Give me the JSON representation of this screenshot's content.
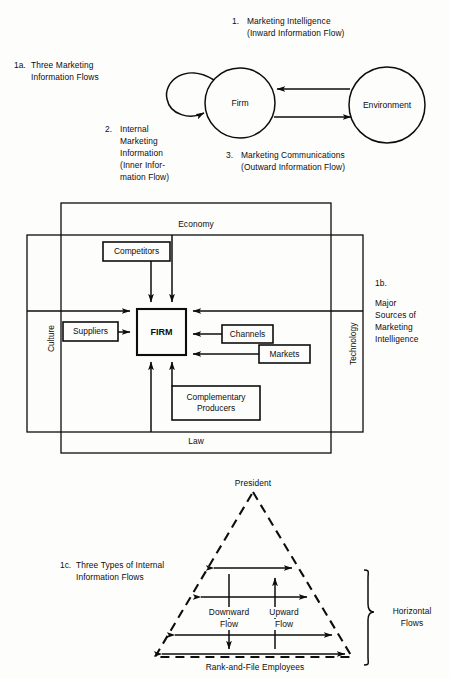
{
  "figure": {
    "panel_a": {
      "key": "1a.",
      "caption_line1": "Three Marketing",
      "caption_line2": "Information Flows",
      "nodes": {
        "firm": "Firm",
        "environment": "Environment"
      },
      "flows": [
        {
          "number": "1.",
          "title": "Marketing Intelligence",
          "subtitle": "(Inward Information Flow)",
          "direction": "environment-to-firm"
        },
        {
          "number": "2.",
          "title_lines": [
            "Internal",
            "Marketing",
            "Information"
          ],
          "subtitle_lines": [
            "(Inner Infor-",
            "mation Flow)"
          ],
          "direction": "firm-to-firm-loop"
        },
        {
          "number": "3.",
          "title": "Marketing Communications",
          "subtitle": "(Outward Information Flow)",
          "direction": "firm-to-environment"
        }
      ]
    },
    "panel_b": {
      "key": "1b.",
      "caption_lines": [
        "Major",
        "Sources of",
        "Marketing",
        "Intelligence"
      ],
      "center_node": "FIRM",
      "outer_frame_labels": {
        "top": "Economy",
        "bottom": "Law"
      },
      "inner_frame_labels": {
        "left": "Culture",
        "right": "Technology"
      },
      "source_boxes": [
        {
          "label": "Competitors",
          "position": "top"
        },
        {
          "label": "Suppliers",
          "position": "left"
        },
        {
          "label": "Channels",
          "position": "right-upper"
        },
        {
          "label": "Markets",
          "position": "right-lower"
        },
        {
          "label_line1": "Complementary",
          "label_line2": "Producers",
          "position": "bottom"
        }
      ]
    },
    "panel_c": {
      "key": "1c.",
      "caption_line1": "Three Types of Internal",
      "caption_line2": "Information Flows",
      "apex_label": "President",
      "base_label": "Rank-and-File Employees",
      "vertical_flows": [
        {
          "label_line1": "Downward",
          "label_line2": "Flow",
          "direction": "down"
        },
        {
          "label_line1": "Upward",
          "label_line2": "Flow",
          "direction": "up"
        }
      ],
      "bracket_label_line1": "Horizontal",
      "bracket_label_line2": "Flows",
      "horizontal_flow_count": 4
    }
  },
  "colors": {
    "ink": "#0d0d0d",
    "paper": "#fdfdfc"
  }
}
